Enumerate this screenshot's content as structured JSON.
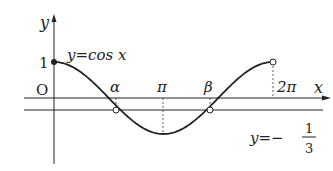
{
  "diagram": {
    "type": "function-graph",
    "axes": {
      "x_label": "x",
      "y_label": "y",
      "origin_label": "O",
      "y_tick_label": "1",
      "x_tick_labels": [
        "α",
        "π",
        "β",
        "2π"
      ]
    },
    "curves": [
      {
        "label": "y=cos x",
        "function": "cos x",
        "domain": "0 ≤ x < 2π",
        "start": "filled",
        "end": "open"
      }
    ],
    "lines": [
      {
        "label_lhs": "y=−",
        "frac_num": "1",
        "frac_den": "3",
        "value": -0.3333
      }
    ],
    "points": [
      {
        "name": "start",
        "x": 0,
        "y": 1,
        "style": "filled"
      },
      {
        "name": "end",
        "x": "2π",
        "y": 1,
        "style": "open"
      },
      {
        "name": "alpha",
        "x": "α",
        "y": -0.3333,
        "style": "open"
      },
      {
        "name": "beta",
        "x": "β",
        "y": -0.3333,
        "style": "open"
      }
    ]
  },
  "labels": {
    "y_axis": "y",
    "x_axis": "x",
    "origin": "O",
    "one": "1",
    "curve_label": "y=cos x",
    "alpha": "α",
    "pi": "π",
    "beta": "β",
    "two_pi": "2π",
    "line_lhs": "y=−",
    "line_num": "1",
    "line_den": "3"
  }
}
